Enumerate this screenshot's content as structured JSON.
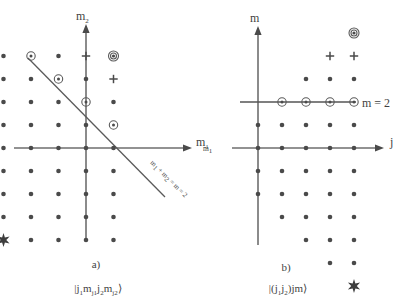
{
  "figure": {
    "panels": [
      {
        "id": "a",
        "caption_label": "a)",
        "ket_label": "|j₁mⱼ₁j₂mⱼ₂⟩",
        "ket_parts": {
          "open": "|",
          "j1": "j",
          "j1sub": "1",
          "m1": "m",
          "m1sub": "j1",
          "j2": "j",
          "j2sub": "2",
          "m2": "m",
          "m2sub": "j2",
          "close": "⟩"
        },
        "x_axis_label": "m",
        "x_axis_sub": "1",
        "y_axis_label": "m",
        "y_axis_sub": "2",
        "line_label": "m₁ + m₂ = m = 2",
        "line_label_parts": [
          "m",
          "1",
          " + m",
          "2",
          " = m = 2"
        ]
      },
      {
        "id": "b",
        "caption_label": "b)",
        "ket_label": "|(j₁j₂)jm⟩",
        "ket_parts": {
          "open": "|(",
          "j1": "j",
          "j1sub": "1",
          "j2": "j",
          "j2sub": "2",
          "close_paren": ")",
          "j": "jm",
          "close": "⟩"
        },
        "x_axis_label": "j",
        "y_axis_label": "m",
        "line_label": "m = 2",
        "edge_label": "m",
        "edge_label_sub": "1"
      }
    ],
    "marker_legend": {
      "dot": "plain-state-dot",
      "ring": "circled-state-dot",
      "plus": "plus-marker",
      "ring_double": "double-circled-dot",
      "star": "star-marker"
    },
    "colors": {
      "ink": "#4a4a4a",
      "axis": "#6e6e6e",
      "background": "#ffffff"
    }
  },
  "chart_data": {
    "type": "scatter",
    "panel_a": {
      "xlabel": "m1",
      "ylabel": "m2",
      "origin_px": [
        86,
        148
      ],
      "step_px": [
        27.5,
        23
      ],
      "grid_cols": [
        -3,
        -2,
        -1,
        0,
        1
      ],
      "grid_rows": [
        4,
        3,
        2,
        1,
        0,
        -1,
        -2,
        -3,
        -4
      ],
      "line": {
        "equation": "m1 + m2 = m = 2",
        "from": [
          -4.3,
          3.9
        ],
        "to": [
          1.9,
          -2.1
        ]
      },
      "markers": [
        {
          "type": "dot",
          "x": -3,
          "y": 4
        },
        {
          "type": "ring",
          "x": -2,
          "y": 4
        },
        {
          "type": "dot",
          "x": -1,
          "y": 4
        },
        {
          "type": "plus",
          "x": 0,
          "y": 4
        },
        {
          "type": "ring-double",
          "x": 1,
          "y": 4
        },
        {
          "type": "dot",
          "x": -3,
          "y": 3
        },
        {
          "type": "dot",
          "x": -2,
          "y": 3
        },
        {
          "type": "ring",
          "x": -1,
          "y": 3
        },
        {
          "type": "dot",
          "x": 0,
          "y": 3
        },
        {
          "type": "plus",
          "x": 1,
          "y": 3
        },
        {
          "type": "dot",
          "x": -3,
          "y": 2
        },
        {
          "type": "dot",
          "x": -2,
          "y": 2
        },
        {
          "type": "dot",
          "x": -1,
          "y": 2
        },
        {
          "type": "ring",
          "x": 0,
          "y": 2
        },
        {
          "type": "dot",
          "x": 1,
          "y": 2
        },
        {
          "type": "dot",
          "x": -3,
          "y": 1
        },
        {
          "type": "dot",
          "x": -2,
          "y": 1
        },
        {
          "type": "dot",
          "x": -1,
          "y": 1
        },
        {
          "type": "dot",
          "x": 0,
          "y": 1
        },
        {
          "type": "ring",
          "x": 1,
          "y": 1
        },
        {
          "type": "dot",
          "x": -3,
          "y": 0
        },
        {
          "type": "dot",
          "x": -2,
          "y": 0
        },
        {
          "type": "dot",
          "x": -1,
          "y": 0
        },
        {
          "type": "dot",
          "x": 0,
          "y": 0
        },
        {
          "type": "dot",
          "x": 1,
          "y": 0
        },
        {
          "type": "dot",
          "x": -3,
          "y": -1
        },
        {
          "type": "dot",
          "x": -2,
          "y": -1
        },
        {
          "type": "dot",
          "x": -1,
          "y": -1
        },
        {
          "type": "dot",
          "x": 0,
          "y": -1
        },
        {
          "type": "dot",
          "x": 1,
          "y": -1
        },
        {
          "type": "dot",
          "x": -3,
          "y": -2
        },
        {
          "type": "dot",
          "x": -2,
          "y": -2
        },
        {
          "type": "dot",
          "x": -1,
          "y": -2
        },
        {
          "type": "dot",
          "x": 0,
          "y": -2
        },
        {
          "type": "dot",
          "x": 1,
          "y": -2
        },
        {
          "type": "dot",
          "x": -3,
          "y": -3
        },
        {
          "type": "dot",
          "x": -2,
          "y": -3
        },
        {
          "type": "dot",
          "x": -1,
          "y": -3
        },
        {
          "type": "dot",
          "x": 0,
          "y": -3
        },
        {
          "type": "dot",
          "x": 1,
          "y": -3
        },
        {
          "type": "star",
          "x": -3,
          "y": -4
        },
        {
          "type": "dot",
          "x": -2,
          "y": -4
        },
        {
          "type": "dot",
          "x": -1,
          "y": -4
        },
        {
          "type": "dot",
          "x": 0,
          "y": -4
        },
        {
          "type": "dot",
          "x": 1,
          "y": -4
        }
      ]
    },
    "panel_b": {
      "xlabel": "j",
      "ylabel": "m",
      "origin_px": [
        258,
        148
      ],
      "step_px": [
        24,
        23
      ],
      "m_line_value": 2,
      "markers": [
        {
          "type": "ring-double",
          "x": 4,
          "y": 5
        },
        {
          "type": "plus",
          "x": 3,
          "y": 4
        },
        {
          "type": "plus",
          "x": 4,
          "y": 4
        },
        {
          "type": "dot",
          "x": 2,
          "y": 3
        },
        {
          "type": "dot",
          "x": 3,
          "y": 3
        },
        {
          "type": "dot",
          "x": 4,
          "y": 3
        },
        {
          "type": "ring",
          "x": 1,
          "y": 2
        },
        {
          "type": "ring",
          "x": 2,
          "y": 2
        },
        {
          "type": "ring",
          "x": 3,
          "y": 2
        },
        {
          "type": "ring",
          "x": 4,
          "y": 2
        },
        {
          "type": "dot",
          "x": 0,
          "y": 1
        },
        {
          "type": "dot",
          "x": 1,
          "y": 1
        },
        {
          "type": "dot",
          "x": 2,
          "y": 1
        },
        {
          "type": "dot",
          "x": 3,
          "y": 1
        },
        {
          "type": "dot",
          "x": 4,
          "y": 1
        },
        {
          "type": "dot",
          "x": 0,
          "y": 0
        },
        {
          "type": "dot",
          "x": 1,
          "y": 0
        },
        {
          "type": "dot",
          "x": 2,
          "y": 0
        },
        {
          "type": "dot",
          "x": 3,
          "y": 0
        },
        {
          "type": "dot",
          "x": 4,
          "y": 0
        },
        {
          "type": "dot",
          "x": 0,
          "y": -1
        },
        {
          "type": "dot",
          "x": 1,
          "y": -1
        },
        {
          "type": "dot",
          "x": 2,
          "y": -1
        },
        {
          "type": "dot",
          "x": 3,
          "y": -1
        },
        {
          "type": "dot",
          "x": 4,
          "y": -1
        },
        {
          "type": "dot",
          "x": 0,
          "y": -2
        },
        {
          "type": "dot",
          "x": 1,
          "y": -2
        },
        {
          "type": "dot",
          "x": 2,
          "y": -2
        },
        {
          "type": "dot",
          "x": 3,
          "y": -2
        },
        {
          "type": "dot",
          "x": 4,
          "y": -2
        },
        {
          "type": "dot",
          "x": 1,
          "y": -3
        },
        {
          "type": "dot",
          "x": 2,
          "y": -3
        },
        {
          "type": "dot",
          "x": 3,
          "y": -3
        },
        {
          "type": "dot",
          "x": 4,
          "y": -3
        },
        {
          "type": "dot",
          "x": 2,
          "y": -4
        },
        {
          "type": "dot",
          "x": 3,
          "y": -4
        },
        {
          "type": "dot",
          "x": 4,
          "y": -4
        },
        {
          "type": "dot",
          "x": 3,
          "y": -5
        },
        {
          "type": "dot",
          "x": 4,
          "y": -5
        },
        {
          "type": "star",
          "x": 4,
          "y": -6
        }
      ]
    }
  }
}
